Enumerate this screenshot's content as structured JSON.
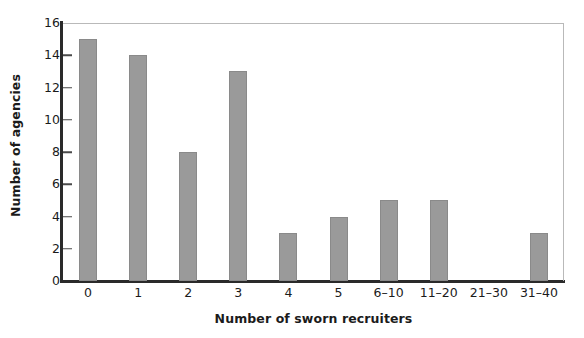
{
  "chart_data": {
    "type": "bar",
    "title": "",
    "subtitle": "",
    "xlabel": "Number of sworn recruiters",
    "ylabel": "Number of agencies",
    "categories": [
      "0",
      "1",
      "2",
      "3",
      "4",
      "5",
      "6–10",
      "11–20",
      "21–30",
      "31–40"
    ],
    "values": [
      15,
      14,
      8,
      13,
      3,
      4,
      5,
      5,
      0,
      3
    ],
    "ylim": [
      0,
      16
    ],
    "yticks": [
      0,
      2,
      4,
      6,
      8,
      10,
      12,
      14,
      16
    ],
    "ytick_labels": [
      "0",
      "2",
      "4",
      "6",
      "8",
      "10",
      "12",
      "14",
      "16"
    ],
    "grid": false,
    "legend": null,
    "legend_position": "none",
    "bar_color": "#9a9a9a",
    "bar_edge_color": "#8a8a8a",
    "axis_color": "#2a2a2a",
    "frame_color": "#b9b9b9",
    "text_color": "#1b1b1b",
    "background_color": "#ffffff",
    "annotations": []
  }
}
